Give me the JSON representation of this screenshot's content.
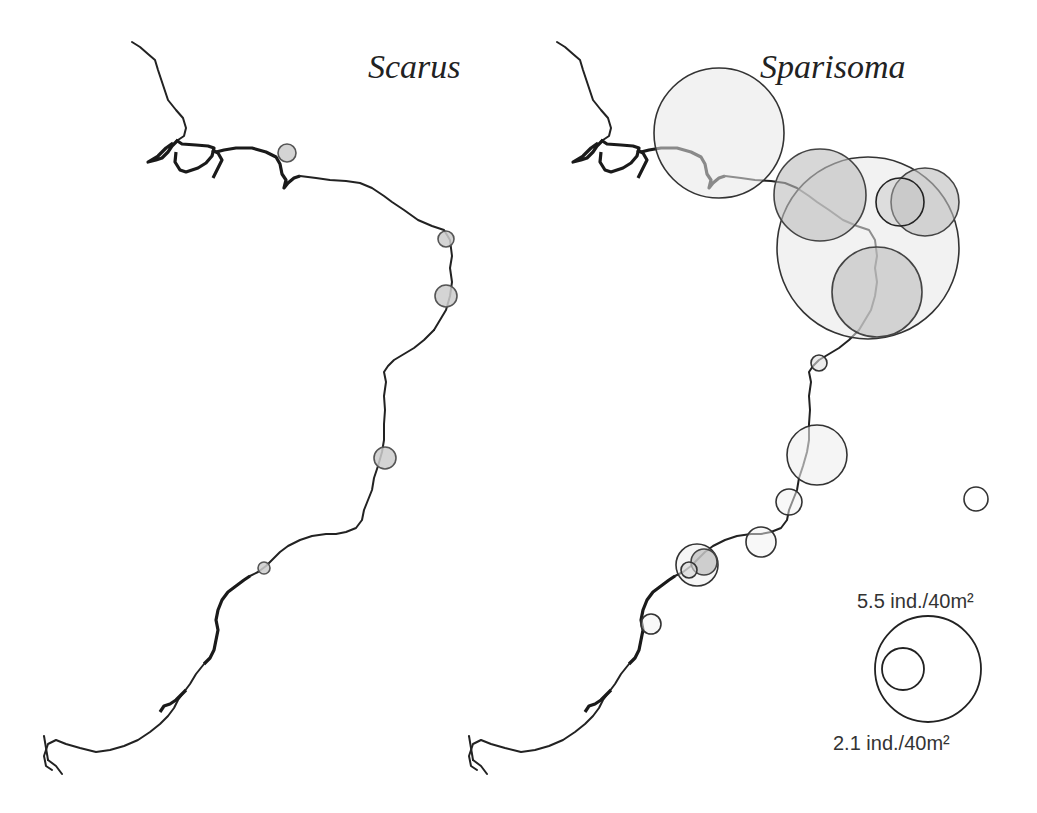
{
  "panels": [
    {
      "id": "scarus",
      "title": "Scarus",
      "offset_x": 0,
      "circles": [
        {
          "cx": 287,
          "cy": 153,
          "r": 9,
          "fill": "#cccccc",
          "fill_opacity": 0.85,
          "stroke": "#555555"
        },
        {
          "cx": 446,
          "cy": 239,
          "r": 8,
          "fill": "#cccccc",
          "fill_opacity": 0.85,
          "stroke": "#555555"
        },
        {
          "cx": 446,
          "cy": 296,
          "r": 11,
          "fill": "#cccccc",
          "fill_opacity": 0.85,
          "stroke": "#555555"
        },
        {
          "cx": 385,
          "cy": 458,
          "r": 11,
          "fill": "#cccccc",
          "fill_opacity": 0.85,
          "stroke": "#555555"
        },
        {
          "cx": 264,
          "cy": 568,
          "r": 6,
          "fill": "#cccccc",
          "fill_opacity": 0.85,
          "stroke": "#555555"
        }
      ]
    },
    {
      "id": "sparisoma",
      "title": "Sparisoma",
      "offset_x": 425,
      "circles": [
        {
          "cx": 719,
          "cy": 133,
          "r": 65,
          "fill": "#e8e8e8",
          "fill_opacity": 0.55,
          "stroke": "#333333"
        },
        {
          "cx": 868,
          "cy": 248,
          "r": 91,
          "fill": "#e8e8e8",
          "fill_opacity": 0.55,
          "stroke": "#333333"
        },
        {
          "cx": 820,
          "cy": 195,
          "r": 46,
          "fill": "#bdbdbd",
          "fill_opacity": 0.6,
          "stroke": "#444444"
        },
        {
          "cx": 925,
          "cy": 202,
          "r": 34,
          "fill": "#bdbdbd",
          "fill_opacity": 0.6,
          "stroke": "#444444"
        },
        {
          "cx": 900,
          "cy": 202,
          "r": 24,
          "fill": "#bdbdbd",
          "fill_opacity": 0.4,
          "stroke": "#222222"
        },
        {
          "cx": 877,
          "cy": 292,
          "r": 45,
          "fill": "#bdbdbd",
          "fill_opacity": 0.6,
          "stroke": "#444444"
        },
        {
          "cx": 819,
          "cy": 363,
          "r": 8,
          "fill": "#e0e0e0",
          "fill_opacity": 0.6,
          "stroke": "#333333"
        },
        {
          "cx": 817,
          "cy": 455,
          "r": 30,
          "fill": "#eeeeee",
          "fill_opacity": 0.6,
          "stroke": "#333333"
        },
        {
          "cx": 789,
          "cy": 502,
          "r": 13,
          "fill": "#f2f2f2",
          "fill_opacity": 0.5,
          "stroke": "#333333"
        },
        {
          "cx": 761,
          "cy": 542,
          "r": 15,
          "fill": "#f2f2f2",
          "fill_opacity": 0.5,
          "stroke": "#333333"
        },
        {
          "cx": 697,
          "cy": 565,
          "r": 21,
          "fill": "#eeeeee",
          "fill_opacity": 0.5,
          "stroke": "#333333"
        },
        {
          "cx": 704,
          "cy": 562,
          "r": 13,
          "fill": "#bdbdbd",
          "fill_opacity": 0.7,
          "stroke": "#444444"
        },
        {
          "cx": 689,
          "cy": 570,
          "r": 8,
          "fill": "#d5d5d5",
          "fill_opacity": 0.6,
          "stroke": "#333333"
        },
        {
          "cx": 651,
          "cy": 624,
          "r": 10,
          "fill": "#f2f2f2",
          "fill_opacity": 0.5,
          "stroke": "#333333"
        },
        {
          "cx": 976,
          "cy": 499,
          "r": 12,
          "fill": "#ffffff",
          "fill_opacity": 0.5,
          "stroke": "#333333"
        }
      ]
    }
  ],
  "legend": {
    "large_label": "5.5 ind./40m²",
    "small_label": "2.1 ind./40m²",
    "large_circle": {
      "cx": 928,
      "cy": 669,
      "r": 53
    },
    "small_circle": {
      "cx": 903,
      "cy": 669,
      "r": 21
    }
  }
}
